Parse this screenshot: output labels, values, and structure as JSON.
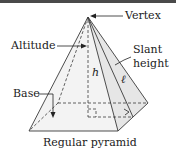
{
  "diagram": {
    "title": "Regular pyramid",
    "labels": {
      "vertex": "Vertex",
      "altitude": "Altitude",
      "slant_height_line1": "Slant",
      "slant_height_line2": "height",
      "base": "Base",
      "h_symbol": "h",
      "l_symbol": "ℓ"
    },
    "colors": {
      "line": "#3a3a3a",
      "face_fill": "#f2f2f2",
      "base_fill": "#d9d9d9",
      "border": "#4a4a4a"
    }
  }
}
